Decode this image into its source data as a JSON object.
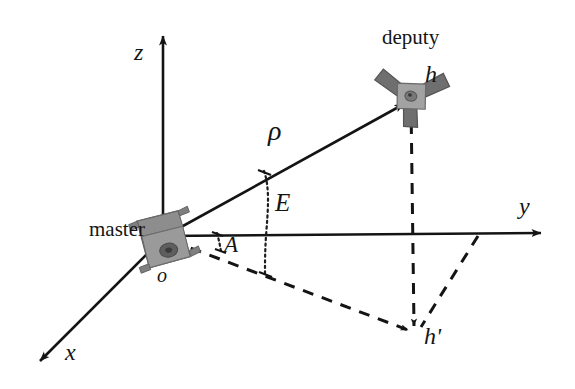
{
  "figure": {
    "type": "3d-coordinate-diagram",
    "background_color": "#ffffff",
    "line_color": "#141414",
    "satellite_fill": "#8a8a8a",
    "satellite_stroke": "#4a4a4a"
  },
  "axes": {
    "origin_label": "o",
    "x_label": "x",
    "y_label": "y",
    "z_label": "z",
    "origin_px": [
      163,
      237
    ],
    "x_tip_px": [
      30,
      370
    ],
    "y_tip_px": [
      551,
      233
    ],
    "z_tip_px": [
      163,
      26
    ]
  },
  "bodies": {
    "master": {
      "label": "master",
      "label_px": [
        88,
        222
      ],
      "icon_name": "master-satellite-icon",
      "position_px": [
        163,
        237
      ]
    },
    "deputy": {
      "label": "deputy",
      "label_px": [
        385,
        31
      ],
      "icon_name": "deputy-satellite-icon",
      "position_px": [
        411,
        100
      ],
      "point_label": "h",
      "point_label_px": [
        425,
        70
      ]
    }
  },
  "measures": {
    "range": {
      "symbol": "ρ",
      "name": "range",
      "label_px": [
        271,
        120
      ],
      "from_px": [
        163,
        237
      ],
      "to_px": [
        408,
        102
      ]
    },
    "elevation": {
      "symbol": "E",
      "name": "elevation-angle",
      "label_px": [
        277,
        196
      ],
      "vertex_px": [
        163,
        237
      ]
    },
    "azimuth": {
      "symbol": "A",
      "name": "azimuth-angle",
      "label_px": [
        227,
        237
      ],
      "vertex_px": [
        163,
        237
      ]
    }
  },
  "projection": {
    "point_label": "h'",
    "point_label_px": [
      428,
      329
    ],
    "point_px": [
      415,
      333
    ],
    "ground_track_from_px": [
      163,
      237
    ],
    "vertical_drop_from_px": [
      411,
      100
    ],
    "y_axis_tie_px": [
      478,
      234
    ]
  }
}
